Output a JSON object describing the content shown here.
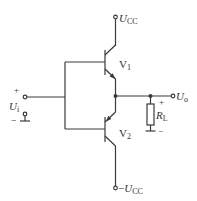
{
  "diagram": {
    "colors": {
      "line": "#3a3a3a",
      "text": "#333333",
      "background": "#ffffff"
    },
    "labels": {
      "vcc_pos_main": "U",
      "vcc_pos_sub": "CC",
      "vcc_neg_prefix": "−",
      "vcc_neg_main": "U",
      "vcc_neg_sub": "CC",
      "v1_main": "V",
      "v1_sub": "1",
      "v2_main": "V",
      "v2_sub": "2",
      "input_main": "U",
      "input_sub": "i",
      "input_plus": "+",
      "input_minus": "−",
      "output_main": "U",
      "output_sub": "o",
      "output_plus": "+",
      "output_minus": "−",
      "load_main": "R",
      "load_sub": "L"
    },
    "components": [
      {
        "id": "V1",
        "type": "NPN transistor"
      },
      {
        "id": "V2",
        "type": "PNP transistor"
      },
      {
        "id": "RL",
        "type": "resistor"
      }
    ]
  }
}
